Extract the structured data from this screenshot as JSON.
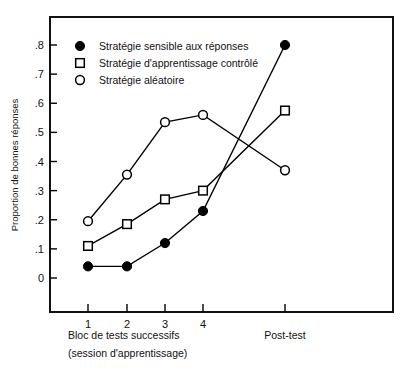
{
  "chart_data": {
    "type": "line",
    "title": "",
    "xlabel": "Bloc de tests successifs (session d'apprentissage)",
    "ylabel": "Proportion de bonnes réponses",
    "categories": [
      "1",
      "2",
      "3",
      "4",
      "Post-test"
    ],
    "x_tick_labels": [
      "1",
      "2",
      "3",
      "4"
    ],
    "x_group_label_line1": "Bloc de tests successifs",
    "x_group_label_line2": "(session d'apprentissage)",
    "x_posttest_label": "Post-test",
    "y_tick_labels": [
      "0",
      ".1",
      ".2",
      ".3",
      ".4",
      ".5",
      ".6",
      ".7",
      ".8"
    ],
    "y_tick_values": [
      0,
      0.1,
      0.2,
      0.3,
      0.4,
      0.5,
      0.6,
      0.7,
      0.8
    ],
    "ylim": [
      0,
      0.8
    ],
    "grid": false,
    "legend_position": "top-left",
    "series": [
      {
        "name": "Stratégie sensible aux réponses",
        "marker": "filled-circle",
        "color": "#000000",
        "values": [
          0.04,
          0.04,
          0.12,
          0.23,
          0.8
        ]
      },
      {
        "name": "Stratégie d'apprentissage contrôlé",
        "marker": "open-square",
        "color": "#000000",
        "values": [
          0.11,
          0.185,
          0.27,
          0.3,
          0.575
        ]
      },
      {
        "name": "Stratégie  aléatoire",
        "marker": "open-circle",
        "color": "#000000",
        "values": [
          0.195,
          0.355,
          0.535,
          0.56,
          0.37
        ]
      }
    ]
  },
  "colors": {
    "axis": "#111111",
    "ink": "#000000",
    "background": "#ffffff"
  }
}
